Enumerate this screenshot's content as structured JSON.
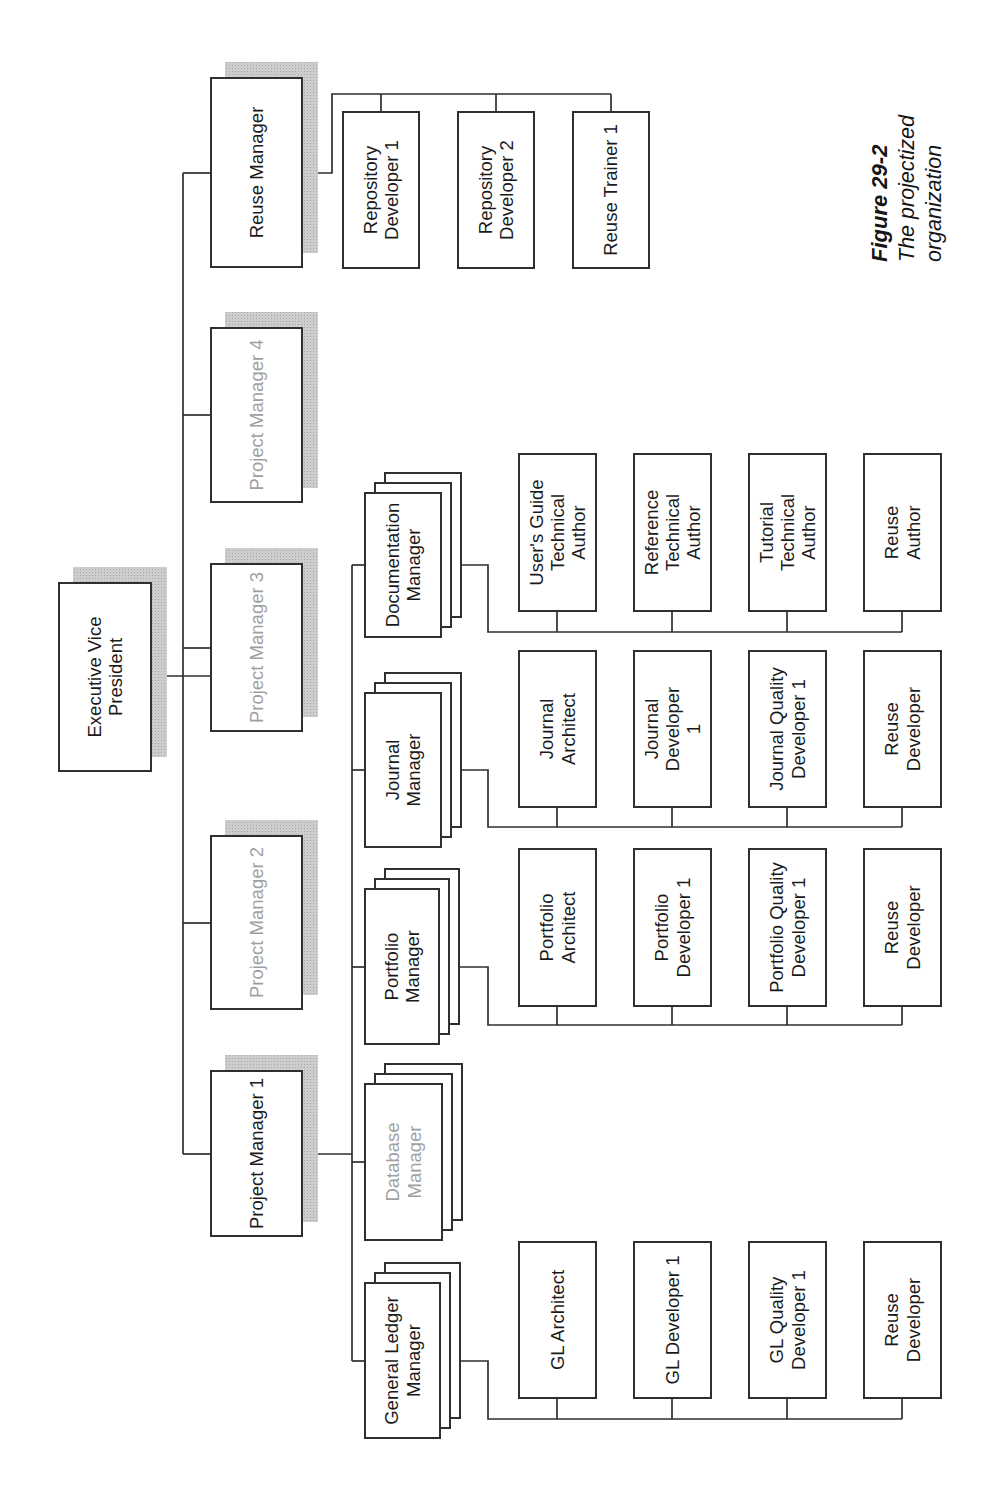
{
  "figure": {
    "caption_title": "Figure 29-2",
    "caption_subtitle": "The projectized organization"
  },
  "palette": {
    "box_border": "#2f2f2f",
    "connector_line": "#2f2f2f",
    "text": "#1a1a1a",
    "dim_text": "#9f9f9f",
    "shadow_fill": "#cdcdcd",
    "shadow_dot": "#a8a8a8",
    "page_background": "#ffffff"
  },
  "org_chart": {
    "canvas": {
      "width": 1500,
      "height": 1001
    },
    "style": {
      "shadow_offset": 15,
      "stack_offset": 10,
      "stack_count": 3,
      "line_width": 1.7
    },
    "nodes": [
      {
        "id": "executive-vice-president",
        "label": "Executive Vice\nPresident",
        "x": 728,
        "y": 58,
        "w": 190,
        "h": 94,
        "shadow": true,
        "stack": false,
        "dim": false
      },
      {
        "id": "project-manager-1",
        "label": "Project Manager 1",
        "x": 263,
        "y": 210,
        "w": 167,
        "h": 93,
        "shadow": true,
        "stack": false,
        "dim": false
      },
      {
        "id": "project-manager-2",
        "label": "Project Manager 2",
        "x": 490,
        "y": 210,
        "w": 175,
        "h": 93,
        "shadow": true,
        "stack": false,
        "dim": true
      },
      {
        "id": "project-manager-3",
        "label": "Project Manager 3",
        "x": 768,
        "y": 210,
        "w": 169,
        "h": 93,
        "shadow": true,
        "stack": false,
        "dim": true
      },
      {
        "id": "project-manager-4",
        "label": "Project Manager 4",
        "x": 997,
        "y": 210,
        "w": 176,
        "h": 93,
        "shadow": true,
        "stack": false,
        "dim": true
      },
      {
        "id": "reuse-manager",
        "label": "Reuse Manager",
        "x": 1232,
        "y": 210,
        "w": 191,
        "h": 93,
        "shadow": true,
        "stack": false,
        "dim": false
      },
      {
        "id": "general-ledger-manager",
        "label": "General Ledger\nManager",
        "x": 61,
        "y": 364,
        "w": 157,
        "h": 77,
        "shadow": false,
        "stack": true,
        "dim": false
      },
      {
        "id": "database-manager",
        "label": "Database\nManager",
        "x": 259,
        "y": 364,
        "w": 158,
        "h": 79,
        "shadow": false,
        "stack": true,
        "dim": true
      },
      {
        "id": "portfolio-manager",
        "label": "Portfolio\nManager",
        "x": 455,
        "y": 364,
        "w": 157,
        "h": 76,
        "shadow": false,
        "stack": true,
        "dim": false
      },
      {
        "id": "journal-manager",
        "label": "Journal\nManager",
        "x": 652,
        "y": 364,
        "w": 156,
        "h": 78,
        "shadow": false,
        "stack": true,
        "dim": false
      },
      {
        "id": "documentation-manager",
        "label": "Documentation\nManager",
        "x": 862,
        "y": 364,
        "w": 146,
        "h": 78,
        "shadow": false,
        "stack": true,
        "dim": false
      },
      {
        "id": "gl-architect",
        "label": "GL Architect",
        "x": 101,
        "y": 518,
        "w": 158,
        "h": 79,
        "shadow": false,
        "stack": false,
        "dim": false
      },
      {
        "id": "gl-developer-1",
        "label": "GL Developer 1",
        "x": 101,
        "y": 633,
        "w": 158,
        "h": 79,
        "shadow": false,
        "stack": false,
        "dim": false
      },
      {
        "id": "gl-quality-developer-1",
        "label": "GL Quality\nDeveloper 1",
        "x": 101,
        "y": 748,
        "w": 158,
        "h": 79,
        "shadow": false,
        "stack": false,
        "dim": false
      },
      {
        "id": "gl-reuse-developer",
        "label": "Reuse\nDeveloper",
        "x": 101,
        "y": 863,
        "w": 158,
        "h": 79,
        "shadow": false,
        "stack": false,
        "dim": false
      },
      {
        "id": "portfolio-architect",
        "label": "Portfolio\nArchitect",
        "x": 493,
        "y": 518,
        "w": 159,
        "h": 79,
        "shadow": false,
        "stack": false,
        "dim": false
      },
      {
        "id": "portfolio-developer-1",
        "label": "Portfolio\nDeveloper 1",
        "x": 493,
        "y": 633,
        "w": 159,
        "h": 79,
        "shadow": false,
        "stack": false,
        "dim": false
      },
      {
        "id": "portfolio-quality-developer-1",
        "label": "Portfolio Quality\nDeveloper 1",
        "x": 493,
        "y": 748,
        "w": 159,
        "h": 79,
        "shadow": false,
        "stack": false,
        "dim": false
      },
      {
        "id": "portfolio-reuse-developer",
        "label": "Reuse\nDeveloper",
        "x": 493,
        "y": 863,
        "w": 159,
        "h": 79,
        "shadow": false,
        "stack": false,
        "dim": false
      },
      {
        "id": "journal-architect",
        "label": "Journal\nArchitect",
        "x": 692,
        "y": 518,
        "w": 158,
        "h": 79,
        "shadow": false,
        "stack": false,
        "dim": false
      },
      {
        "id": "journal-developer-1",
        "label": "Journal\nDeveloper\n1",
        "x": 692,
        "y": 633,
        "w": 158,
        "h": 79,
        "shadow": false,
        "stack": false,
        "dim": false
      },
      {
        "id": "journal-quality-developer-1",
        "label": "Journal Quality\nDeveloper 1",
        "x": 692,
        "y": 748,
        "w": 158,
        "h": 79,
        "shadow": false,
        "stack": false,
        "dim": false
      },
      {
        "id": "journal-reuse-developer",
        "label": "Reuse\nDeveloper",
        "x": 692,
        "y": 863,
        "w": 158,
        "h": 79,
        "shadow": false,
        "stack": false,
        "dim": false
      },
      {
        "id": "users-guide-technical-author",
        "label": "User's Guide\nTechnical\nAuthor",
        "x": 888,
        "y": 518,
        "w": 159,
        "h": 79,
        "shadow": false,
        "stack": false,
        "dim": false
      },
      {
        "id": "reference-technical-author",
        "label": "Reference\nTechnical\nAuthor",
        "x": 888,
        "y": 633,
        "w": 159,
        "h": 79,
        "shadow": false,
        "stack": false,
        "dim": false
      },
      {
        "id": "tutorial-technical-author",
        "label": "Tutorial\nTechnical\nAuthor",
        "x": 888,
        "y": 748,
        "w": 159,
        "h": 79,
        "shadow": false,
        "stack": false,
        "dim": false
      },
      {
        "id": "reuse-author",
        "label": "Reuse\nAuthor",
        "x": 888,
        "y": 863,
        "w": 159,
        "h": 79,
        "shadow": false,
        "stack": false,
        "dim": false
      },
      {
        "id": "repository-developer-1",
        "label": "Repository\nDeveloper 1",
        "x": 1231,
        "y": 342,
        "w": 158,
        "h": 78,
        "shadow": false,
        "stack": false,
        "dim": false
      },
      {
        "id": "repository-developer-2",
        "label": "Repository\nDeveloper 2",
        "x": 1231,
        "y": 457,
        "w": 158,
        "h": 78,
        "shadow": false,
        "stack": false,
        "dim": false
      },
      {
        "id": "reuse-trainer-1",
        "label": "Reuse Trainer 1",
        "x": 1231,
        "y": 572,
        "w": 158,
        "h": 78,
        "shadow": false,
        "stack": false,
        "dim": false
      }
    ],
    "connectors": [
      [
        [
          824,
          152
        ],
        [
          824,
          210
        ]
      ],
      [
        [
          346,
          183
        ],
        [
          1327,
          183
        ]
      ],
      [
        [
          346,
          183
        ],
        [
          346,
          210
        ]
      ],
      [
        [
          577,
          183
        ],
        [
          577,
          210
        ]
      ],
      [
        [
          852,
          183
        ],
        [
          852,
          210
        ]
      ],
      [
        [
          1085,
          183
        ],
        [
          1085,
          210
        ]
      ],
      [
        [
          1327,
          183
        ],
        [
          1327,
          210
        ]
      ],
      [
        [
          346,
          303
        ],
        [
          346,
          352
        ]
      ],
      [
        [
          139,
          352
        ],
        [
          935,
          352
        ]
      ],
      [
        [
          139,
          352
        ],
        [
          139,
          364
        ]
      ],
      [
        [
          338,
          352
        ],
        [
          338,
          364
        ]
      ],
      [
        [
          533,
          352
        ],
        [
          533,
          364
        ]
      ],
      [
        [
          730,
          352
        ],
        [
          730,
          364
        ]
      ],
      [
        [
          935,
          352
        ],
        [
          935,
          364
        ]
      ],
      [
        [
          139,
          441
        ],
        [
          139,
          488
        ],
        [
          81,
          488
        ],
        [
          81,
          902
        ]
      ],
      [
        [
          81,
          557
        ],
        [
          101,
          557
        ]
      ],
      [
        [
          81,
          672
        ],
        [
          101,
          672
        ]
      ],
      [
        [
          81,
          787
        ],
        [
          101,
          787
        ]
      ],
      [
        [
          81,
          902
        ],
        [
          101,
          902
        ]
      ],
      [
        [
          533,
          440
        ],
        [
          533,
          488
        ],
        [
          475,
          488
        ],
        [
          475,
          902
        ]
      ],
      [
        [
          475,
          557
        ],
        [
          493,
          557
        ]
      ],
      [
        [
          475,
          672
        ],
        [
          493,
          672
        ]
      ],
      [
        [
          475,
          787
        ],
        [
          493,
          787
        ]
      ],
      [
        [
          475,
          902
        ],
        [
          493,
          902
        ]
      ],
      [
        [
          730,
          442
        ],
        [
          730,
          488
        ],
        [
          673,
          488
        ],
        [
          673,
          902
        ]
      ],
      [
        [
          673,
          557
        ],
        [
          692,
          557
        ]
      ],
      [
        [
          673,
          672
        ],
        [
          692,
          672
        ]
      ],
      [
        [
          673,
          787
        ],
        [
          692,
          787
        ]
      ],
      [
        [
          673,
          902
        ],
        [
          692,
          902
        ]
      ],
      [
        [
          935,
          442
        ],
        [
          935,
          488
        ],
        [
          868,
          488
        ],
        [
          868,
          902
        ]
      ],
      [
        [
          868,
          557
        ],
        [
          888,
          557
        ]
      ],
      [
        [
          868,
          672
        ],
        [
          888,
          672
        ]
      ],
      [
        [
          868,
          787
        ],
        [
          888,
          787
        ]
      ],
      [
        [
          868,
          902
        ],
        [
          888,
          902
        ]
      ],
      [
        [
          1327,
          303
        ],
        [
          1327,
          332
        ],
        [
          1406,
          332
        ],
        [
          1406,
          611
        ]
      ],
      [
        [
          1406,
          381
        ],
        [
          1389,
          381
        ]
      ],
      [
        [
          1406,
          496
        ],
        [
          1389,
          496
        ]
      ],
      [
        [
          1406,
          611
        ],
        [
          1389,
          611
        ]
      ]
    ]
  }
}
